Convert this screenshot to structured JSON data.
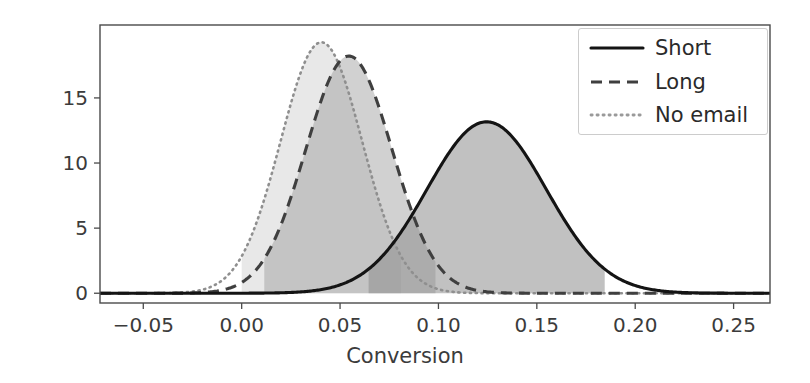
{
  "chart_data": {
    "type": "line",
    "title": "",
    "subtitle": "",
    "xlabel": "Conversion",
    "ylabel": "",
    "xlim": [
      -0.072,
      0.2685
    ],
    "ylim": [
      -0.75,
      20.6
    ],
    "grid": false,
    "legend_position": "upper right",
    "xticks": [
      -0.05,
      0.0,
      0.05,
      0.1,
      0.15,
      0.2,
      0.25
    ],
    "xtick_labels": [
      "−0.05",
      "0.00",
      "0.05",
      "0.10",
      "0.15",
      "0.20",
      "0.25"
    ],
    "yticks": [
      0,
      5,
      10,
      15
    ],
    "ytick_labels": [
      "0",
      "5",
      "10",
      "15"
    ],
    "series": [
      {
        "name": "Short",
        "linestyle": "solid",
        "color": "#1a1a1a",
        "mean": 0.1245,
        "sigma": 0.0303,
        "peak_value": 13.2,
        "fill_color": "#8e8e8e",
        "fill_opacity": 0.55,
        "interval_low": 0.0645,
        "interval_high": 0.1845
      },
      {
        "name": "Long",
        "linestyle": "dashed",
        "color": "#3d3d3d",
        "mean": 0.0545,
        "sigma": 0.0219,
        "peak_value": 18.3,
        "fill_color": "#9a9a9a",
        "fill_opacity": 0.42,
        "interval_low": 0.0115,
        "interval_high": 0.0985
      },
      {
        "name": "No email",
        "linestyle": "dotted",
        "color": "#8a8a8a",
        "mean": 0.0405,
        "sigma": 0.0207,
        "peak_value": 19.3,
        "fill_color": "#c8c8c8",
        "fill_opacity": 0.35,
        "interval_low": 0.0,
        "interval_high": 0.081
      }
    ],
    "legend_entries": [
      {
        "label": "Short",
        "linestyle": "solid"
      },
      {
        "label": "Long",
        "linestyle": "dashed"
      },
      {
        "label": "No email",
        "linestyle": "dotted"
      }
    ]
  },
  "legend": {
    "items": [
      {
        "label": "Short"
      },
      {
        "label": "Long"
      },
      {
        "label": "No email"
      }
    ]
  },
  "axes": {
    "xlabel": "Conversion",
    "xtick_labels": [
      "−0.05",
      "0.00",
      "0.05",
      "0.10",
      "0.15",
      "0.20",
      "0.25"
    ],
    "ytick_labels": [
      "0",
      "5",
      "10",
      "15"
    ]
  }
}
